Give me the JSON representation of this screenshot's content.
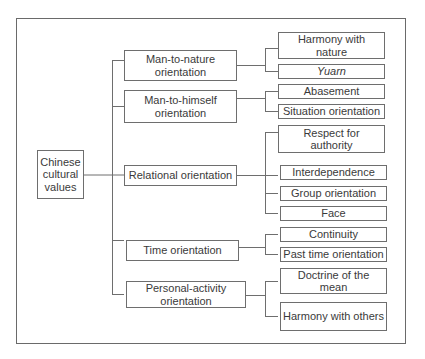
{
  "diagram": {
    "root": {
      "label": "Chinese cultural values"
    },
    "categories": [
      {
        "label": "Man-to-nature orientation",
        "children": [
          {
            "label": "Harmony with nature"
          },
          {
            "label": "Yuarn",
            "italic": true
          }
        ]
      },
      {
        "label": "Man-to-himself orientation",
        "children": [
          {
            "label": "Abasement"
          },
          {
            "label": "Situation orientation"
          }
        ]
      },
      {
        "label": "Relational orientation",
        "children": [
          {
            "label": "Respect for authority"
          },
          {
            "label": "Interdependence"
          },
          {
            "label": "Group orientation"
          },
          {
            "label": "Face"
          }
        ]
      },
      {
        "label": "Time orientation",
        "children": [
          {
            "label": "Continuity"
          },
          {
            "label": "Past time orientation"
          }
        ]
      },
      {
        "label": "Personal-activity orientation",
        "children": [
          {
            "label": "Doctrine of the mean"
          },
          {
            "label": "Harmony with others"
          }
        ]
      }
    ]
  },
  "colors": {
    "line": "#6e6e6e",
    "text": "#3a3a3a",
    "background": "#ffffff"
  }
}
